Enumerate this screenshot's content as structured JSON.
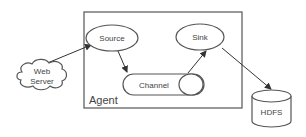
{
  "diagram": {
    "type": "architecture",
    "container": {
      "label": "Agent"
    },
    "nodes": [
      {
        "id": "web_server",
        "label_lines": [
          "Web",
          "Server"
        ],
        "shape": "cloud"
      },
      {
        "id": "source",
        "label": "Source",
        "shape": "ellipse"
      },
      {
        "id": "channel",
        "label": "Channel",
        "shape": "capsule"
      },
      {
        "id": "sink",
        "label": "Sink",
        "shape": "ellipse"
      },
      {
        "id": "hdfs",
        "label": "HDFS",
        "shape": "cylinder"
      }
    ],
    "edges": [
      {
        "from": "web_server",
        "to": "source"
      },
      {
        "from": "source",
        "to": "channel"
      },
      {
        "from": "channel",
        "to": "sink"
      },
      {
        "from": "sink",
        "to": "hdfs"
      }
    ],
    "colors": {
      "stroke": "#555555",
      "text": "#444444",
      "background": "#ffffff"
    }
  }
}
